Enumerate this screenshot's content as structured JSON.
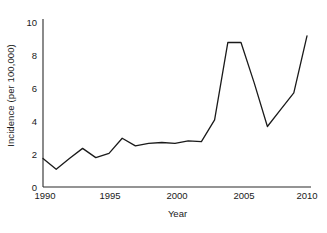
{
  "chart_data": {
    "type": "line",
    "title": "",
    "xlabel": "Year",
    "ylabel": "Incidence (per 100,000)",
    "xlim": [
      1990,
      2010
    ],
    "ylim": [
      0,
      10
    ],
    "xticks": [
      1990,
      1995,
      2000,
      2005,
      2010
    ],
    "yticks": [
      0,
      2,
      4,
      6,
      8,
      10
    ],
    "grid": false,
    "legend": null,
    "line_color": "#1a1a1a",
    "x": [
      1990,
      1991,
      1992,
      1993,
      1994,
      1995,
      1996,
      1997,
      1998,
      1999,
      2000,
      2001,
      2002,
      2003,
      2004,
      2005,
      2006,
      2007,
      2008,
      2009,
      2010
    ],
    "values": [
      1.7,
      1.05,
      1.7,
      2.3,
      1.75,
      2.0,
      2.9,
      2.45,
      2.6,
      2.65,
      2.6,
      2.75,
      2.7,
      4.0,
      8.6,
      8.6,
      6.2,
      3.6,
      4.6,
      5.6,
      9.0
    ],
    "series": [
      {
        "name": "Incidence",
        "values": [
          1.7,
          1.05,
          1.7,
          2.3,
          1.75,
          2.0,
          2.9,
          2.45,
          2.6,
          2.65,
          2.6,
          2.75,
          2.7,
          4.0,
          8.6,
          8.6,
          6.2,
          3.6,
          4.6,
          5.6,
          9.0
        ]
      }
    ],
    "annotations": []
  },
  "axes": {
    "y_title": "Incidence (per 100,000)",
    "x_title": "Year",
    "y_tick_labels": [
      "10",
      "8",
      "6",
      "4",
      "2",
      "0"
    ],
    "x_tick_labels": [
      "1990",
      "1995",
      "2000",
      "2005",
      "2010"
    ]
  }
}
